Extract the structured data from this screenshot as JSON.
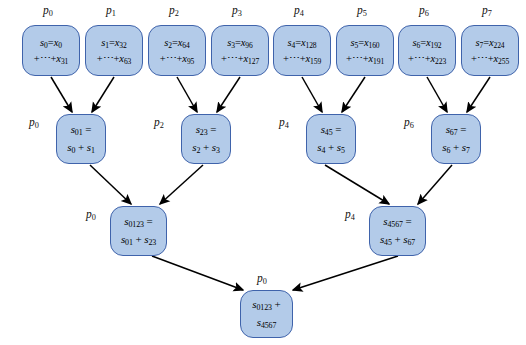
{
  "diagram": {
    "colors": {
      "node_fill": "#b3cbe9",
      "node_border": "#3f63ab",
      "edge": "#000000",
      "background": "#ffffff"
    },
    "levels": [
      {
        "name": "level-0-leaves",
        "nodes": [
          {
            "id": "n0",
            "proc": "p",
            "proc_sub": "0",
            "line1_lhs": "s",
            "line1_lhs_sub": "0",
            "line1_rhs": "x",
            "line1_rhs_sub": "0",
            "line2_var": "x",
            "line2_sub": "31"
          },
          {
            "id": "n1",
            "proc": "p",
            "proc_sub": "1",
            "line1_lhs": "s",
            "line1_lhs_sub": "1",
            "line1_rhs": "x",
            "line1_rhs_sub": "32",
            "line2_var": "x",
            "line2_sub": "63"
          },
          {
            "id": "n2",
            "proc": "p",
            "proc_sub": "2",
            "line1_lhs": "s",
            "line1_lhs_sub": "2",
            "line1_rhs": "x",
            "line1_rhs_sub": "64",
            "line2_var": "x",
            "line2_sub": "95"
          },
          {
            "id": "n3",
            "proc": "p",
            "proc_sub": "3",
            "line1_lhs": "s",
            "line1_lhs_sub": "3",
            "line1_rhs": "x",
            "line1_rhs_sub": "96",
            "line2_var": "x",
            "line2_sub": "127"
          },
          {
            "id": "n4",
            "proc": "p",
            "proc_sub": "4",
            "line1_lhs": "s",
            "line1_lhs_sub": "4",
            "line1_rhs": "x",
            "line1_rhs_sub": "128",
            "line2_var": "x",
            "line2_sub": "159"
          },
          {
            "id": "n5",
            "proc": "p",
            "proc_sub": "5",
            "line1_lhs": "s",
            "line1_lhs_sub": "5",
            "line1_rhs": "x",
            "line1_rhs_sub": "160",
            "line2_var": "x",
            "line2_sub": "191"
          },
          {
            "id": "n6",
            "proc": "p",
            "proc_sub": "6",
            "line1_lhs": "s",
            "line1_lhs_sub": "6",
            "line1_rhs": "x",
            "line1_rhs_sub": "192",
            "line2_var": "x",
            "line2_sub": "223"
          },
          {
            "id": "n7",
            "proc": "p",
            "proc_sub": "7",
            "line1_lhs": "s",
            "line1_lhs_sub": "7",
            "line1_rhs": "x",
            "line1_rhs_sub": "224",
            "line2_var": "x",
            "line2_sub": "255"
          }
        ]
      },
      {
        "name": "level-1",
        "nodes": [
          {
            "id": "m01",
            "proc": "p",
            "proc_sub": "0",
            "res_sub": "01",
            "a_sub": "0",
            "b_sub": "1"
          },
          {
            "id": "m23",
            "proc": "p",
            "proc_sub": "2",
            "res_sub": "23",
            "a_sub": "2",
            "b_sub": "3"
          },
          {
            "id": "m45",
            "proc": "p",
            "proc_sub": "4",
            "res_sub": "45",
            "a_sub": "4",
            "b_sub": "5"
          },
          {
            "id": "m67",
            "proc": "p",
            "proc_sub": "6",
            "res_sub": "67",
            "a_sub": "6",
            "b_sub": "7"
          }
        ]
      },
      {
        "name": "level-2",
        "nodes": [
          {
            "id": "b0123",
            "proc": "p",
            "proc_sub": "0",
            "res_sub": "0123",
            "a_sub": "01",
            "b_sub": "23"
          },
          {
            "id": "b4567",
            "proc": "p",
            "proc_sub": "4",
            "res_sub": "4567",
            "a_sub": "45",
            "b_sub": "67"
          }
        ]
      },
      {
        "name": "level-3-root",
        "nodes": [
          {
            "id": "root",
            "proc": "p",
            "proc_sub": "0",
            "line1_var": "s",
            "line1_sub": "0123",
            "op": "+",
            "line2_var": "s",
            "line2_sub": "4567"
          }
        ]
      }
    ],
    "symbols": {
      "equals": "=",
      "plus": "+",
      "ellipsis_sum": "+⋯+",
      "var_s": "s",
      "var_x": "x",
      "var_p": "p"
    },
    "edges": [
      {
        "from": "n0",
        "to": "m01"
      },
      {
        "from": "n1",
        "to": "m01"
      },
      {
        "from": "n2",
        "to": "m23"
      },
      {
        "from": "n3",
        "to": "m23"
      },
      {
        "from": "n4",
        "to": "m45"
      },
      {
        "from": "n5",
        "to": "m45"
      },
      {
        "from": "n6",
        "to": "m67"
      },
      {
        "from": "n7",
        "to": "m67"
      },
      {
        "from": "m01",
        "to": "b0123"
      },
      {
        "from": "m23",
        "to": "b0123"
      },
      {
        "from": "m45",
        "to": "b4567"
      },
      {
        "from": "m67",
        "to": "b4567"
      },
      {
        "from": "b0123",
        "to": "root"
      },
      {
        "from": "b4567",
        "to": "root"
      }
    ]
  }
}
